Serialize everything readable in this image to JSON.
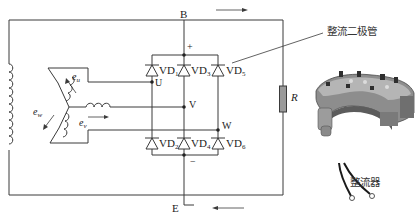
{
  "diagram": {
    "nodes": {
      "B": "B",
      "E": "E",
      "U": "U",
      "V": "V",
      "W": "W",
      "plus": "+",
      "minus": "−"
    },
    "load": {
      "label": "R"
    },
    "emf_labels": {
      "eu": {
        "base": "e",
        "sub": "u"
      },
      "ev": {
        "base": "e",
        "sub": "v"
      },
      "ew": {
        "base": "e",
        "sub": "w"
      }
    },
    "diodes": [
      {
        "id": "VD1",
        "base": "VD",
        "sub": "1",
        "row": "upper"
      },
      {
        "id": "VD3",
        "base": "VD",
        "sub": "3",
        "row": "upper"
      },
      {
        "id": "VD5",
        "base": "VD",
        "sub": "5",
        "row": "upper"
      },
      {
        "id": "VD2",
        "base": "VD",
        "sub": "2",
        "row": "lower"
      },
      {
        "id": "VD4",
        "base": "VD",
        "sub": "4",
        "row": "lower"
      },
      {
        "id": "VD6",
        "base": "VD",
        "sub": "6",
        "row": "lower"
      }
    ],
    "current_arrows": [
      {
        "position": "top",
        "direction": "right"
      },
      {
        "position": "bottom",
        "direction": "left"
      }
    ],
    "callouts": {
      "rectifier_diode": "整流二极管",
      "rectifier": "整流器"
    },
    "colors": {
      "line": "#3a3a3a",
      "resistor_fill": "#9a9a9a",
      "background": "#ffffff"
    }
  }
}
